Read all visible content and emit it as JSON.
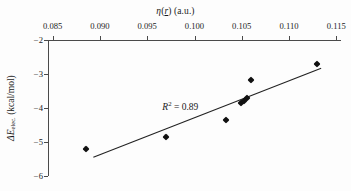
{
  "chart_data": {
    "type": "scatter",
    "title": "",
    "xlabel": "η(r) (a.u.)",
    "ylabel": "ΔEelec. (kcal/mol)",
    "xlabel_parts": {
      "eta": "η",
      "open": "(",
      "vector": "r",
      "close": ")",
      "units": " (a.u.)"
    },
    "ylabel_parts": {
      "delta_e": "ΔE",
      "subscript": "elec.",
      "units": " (kcal/mol)"
    },
    "xlim": [
      0.0845,
      0.1155
    ],
    "ylim": [
      -6,
      -2
    ],
    "xticks": [
      0.085,
      0.09,
      0.095,
      0.1,
      0.105,
      0.11,
      0.115
    ],
    "xticklabels": [
      "0.085",
      "0.090",
      "0.095",
      "0.100",
      "0.105",
      "0.110",
      "0.115"
    ],
    "yticks": [
      -2,
      -3,
      -4,
      -5,
      -6
    ],
    "yticklabels": [
      "−2",
      "−3",
      "−4",
      "−5",
      "−6"
    ],
    "x_axis_position": "top",
    "y_axis_position": "left",
    "grid": false,
    "legend": null,
    "x": [
      0.0885,
      0.097,
      0.1033,
      0.1049,
      0.1052,
      0.1056,
      0.106,
      0.113
    ],
    "y": [
      -5.2,
      -4.85,
      -4.35,
      -3.85,
      -3.8,
      -3.72,
      -3.18,
      -2.72
    ],
    "marker": "diamond",
    "marker_color": "#111111",
    "trendline": {
      "type": "linear",
      "x_start": 0.0893,
      "y_start": -5.45,
      "x_end": 0.1134,
      "y_end": -2.83,
      "color": "#222222"
    },
    "annotations": [
      {
        "name": "r-squared",
        "text": "R2 = 0.89",
        "symbol": "R",
        "exponent": "2",
        "equals_value": " = 0.89",
        "x": 0.0985,
        "y": -3.93
      }
    ]
  },
  "figure": {
    "background": "#fdfdfd",
    "axis_color": "#4a4a4a",
    "text_color": "#1b1b1b"
  }
}
